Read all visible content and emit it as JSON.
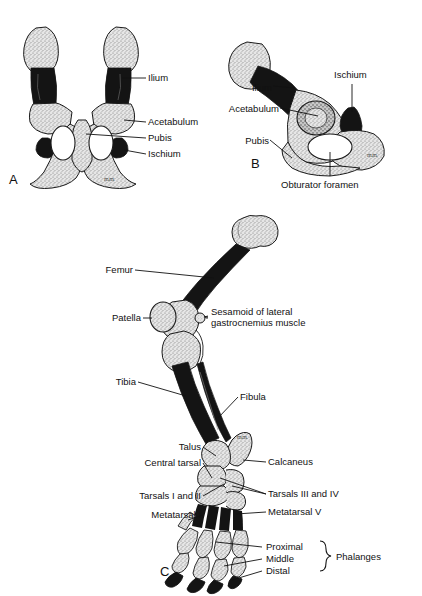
{
  "figure": {
    "background_color": "#ffffff",
    "ink_color": "#111111",
    "bone_light_color": "#d9d9d9",
    "bone_dark_color": "#141414"
  },
  "panels": [
    {
      "letter": "A",
      "name": "pelvis-ventral",
      "labels": [
        {
          "text": "Ilium",
          "side": "right"
        },
        {
          "text": "Acetabulum",
          "side": "right"
        },
        {
          "text": "Pubis",
          "side": "right"
        },
        {
          "text": "Ischium",
          "side": "right"
        }
      ]
    },
    {
      "letter": "B",
      "name": "pelvis-lateral",
      "labels": [
        {
          "text": "Ilium",
          "side": "left"
        },
        {
          "text": "Acetabulum",
          "side": "left"
        },
        {
          "text": "Pubis",
          "side": "left"
        },
        {
          "text": "Ischium",
          "side": "right"
        },
        {
          "text": "Obturator foramen",
          "side": "bottom"
        }
      ]
    },
    {
      "letter": "C",
      "name": "pelvic-limb",
      "labels": [
        {
          "text": "Femur",
          "side": "left"
        },
        {
          "text": "Patella",
          "side": "left"
        },
        {
          "text": "Sesamoid of lateral",
          "side": "right"
        },
        {
          "text": "gastrocnemius muscle",
          "side": "right"
        },
        {
          "text": "Tibia",
          "side": "left"
        },
        {
          "text": "Fibula",
          "side": "right"
        },
        {
          "text": "Talus",
          "side": "left"
        },
        {
          "text": "Central tarsal",
          "side": "left"
        },
        {
          "text": "Calcaneus",
          "side": "right"
        },
        {
          "text": "Tarsals I and II",
          "side": "left"
        },
        {
          "text": "Tarsals III and IV",
          "side": "right"
        },
        {
          "text": "Metatarsal I",
          "side": "left"
        },
        {
          "text": "Metatarsal V",
          "side": "right"
        },
        {
          "text": "Proximal",
          "side": "right"
        },
        {
          "text": "Middle",
          "side": "right"
        },
        {
          "text": "Distal",
          "side": "right"
        },
        {
          "text": "Phalanges",
          "side": "right"
        }
      ]
    }
  ],
  "panel_a": {
    "letter": "A",
    "ilium": "Ilium",
    "acetabulum": "Acetabulum",
    "pubis": "Pubis",
    "ischium": "Ischium",
    "signature": "m.m."
  },
  "panel_b": {
    "letter": "B",
    "ilium": "Ilium",
    "acetabulum": "Acetabulum",
    "pubis": "Pubis",
    "ischium": "Ischium",
    "obturator_foramen": "Obturator foramen",
    "signature": "m.m."
  },
  "panel_c": {
    "letter": "C",
    "femur": "Femur",
    "patella": "Patella",
    "sesamoid_line1": "Sesamoid of lateral",
    "sesamoid_line2": "gastrocnemius muscle",
    "tibia": "Tibia",
    "fibula": "Fibula",
    "talus": "Talus",
    "central_tarsal": "Central tarsal",
    "calcaneus": "Calcaneus",
    "tarsals_1_2": "Tarsals I and II",
    "tarsals_3_4": "Tarsals III and IV",
    "metatarsal_1": "Metatarsal I",
    "metatarsal_5": "Metatarsal V",
    "proximal": "Proximal",
    "middle": "Middle",
    "distal": "Distal",
    "phalanges": "Phalanges",
    "signature": "m.m."
  }
}
